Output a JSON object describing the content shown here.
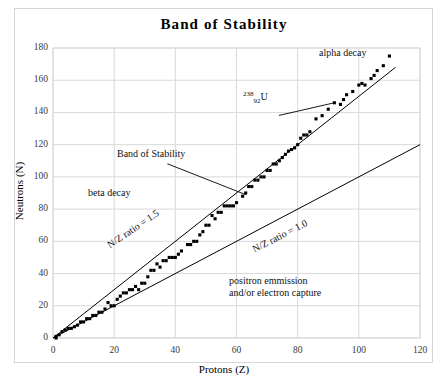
{
  "chart_data": {
    "type": "scatter",
    "title": "Band of Stability",
    "xlabel": "Protons (Z)",
    "ylabel": "Neutrons (N)",
    "xlim": [
      0,
      120
    ],
    "ylim": [
      0,
      180
    ],
    "xticks": [
      0,
      20,
      40,
      60,
      80,
      100,
      120
    ],
    "yticks": [
      0,
      20,
      40,
      60,
      80,
      100,
      120,
      140,
      160,
      180
    ],
    "grid": true,
    "legend": "none",
    "series": [
      {
        "name": "Stable nuclides (band of stability)",
        "marker": "square",
        "color": "#000000",
        "points": [
          [
            1,
            0
          ],
          [
            1,
            1
          ],
          [
            2,
            2
          ],
          [
            3,
            4
          ],
          [
            4,
            5
          ],
          [
            5,
            6
          ],
          [
            6,
            6
          ],
          [
            7,
            7
          ],
          [
            8,
            8
          ],
          [
            9,
            10
          ],
          [
            10,
            10
          ],
          [
            11,
            12
          ],
          [
            12,
            12
          ],
          [
            13,
            14
          ],
          [
            14,
            14
          ],
          [
            15,
            16
          ],
          [
            16,
            16
          ],
          [
            17,
            18
          ],
          [
            18,
            22
          ],
          [
            19,
            20
          ],
          [
            20,
            20
          ],
          [
            21,
            24
          ],
          [
            22,
            26
          ],
          [
            23,
            28
          ],
          [
            24,
            28
          ],
          [
            25,
            30
          ],
          [
            26,
            30
          ],
          [
            27,
            32
          ],
          [
            28,
            30
          ],
          [
            29,
            34
          ],
          [
            30,
            34
          ],
          [
            31,
            38
          ],
          [
            32,
            42
          ],
          [
            33,
            42
          ],
          [
            34,
            46
          ],
          [
            35,
            44
          ],
          [
            36,
            48
          ],
          [
            37,
            48
          ],
          [
            38,
            50
          ],
          [
            39,
            50
          ],
          [
            40,
            50
          ],
          [
            41,
            52
          ],
          [
            42,
            54
          ],
          [
            44,
            58
          ],
          [
            45,
            58
          ],
          [
            46,
            60
          ],
          [
            47,
            60
          ],
          [
            48,
            64
          ],
          [
            49,
            66
          ],
          [
            50,
            70
          ],
          [
            51,
            70
          ],
          [
            52,
            76
          ],
          [
            53,
            74
          ],
          [
            54,
            78
          ],
          [
            55,
            78
          ],
          [
            56,
            82
          ],
          [
            57,
            82
          ],
          [
            58,
            82
          ],
          [
            59,
            82
          ],
          [
            60,
            84
          ],
          [
            62,
            88
          ],
          [
            63,
            90
          ],
          [
            64,
            94
          ],
          [
            65,
            94
          ],
          [
            66,
            98
          ],
          [
            67,
            98
          ],
          [
            68,
            100
          ],
          [
            69,
            100
          ],
          [
            70,
            104
          ],
          [
            71,
            104
          ],
          [
            72,
            108
          ],
          [
            73,
            108
          ],
          [
            74,
            110
          ],
          [
            75,
            112
          ],
          [
            76,
            114
          ],
          [
            77,
            116
          ],
          [
            78,
            117
          ],
          [
            79,
            118
          ],
          [
            80,
            120
          ],
          [
            81,
            124
          ],
          [
            82,
            126
          ],
          [
            83,
            126
          ],
          [
            84,
            128
          ],
          [
            86,
            136
          ],
          [
            88,
            138
          ],
          [
            90,
            142
          ],
          [
            92,
            146
          ],
          [
            94,
            145
          ],
          [
            95,
            148
          ],
          [
            96,
            151
          ],
          [
            98,
            153
          ],
          [
            100,
            157
          ],
          [
            101,
            158
          ],
          [
            102,
            157
          ],
          [
            104,
            161
          ],
          [
            105,
            163
          ],
          [
            106,
            166
          ],
          [
            108,
            169
          ],
          [
            110,
            175
          ]
        ]
      }
    ],
    "reference_lines": [
      {
        "name": "N/Z ratio = 1.5",
        "label": "N/Z ratio = 1.5",
        "slope": 1.5,
        "x_from": 0,
        "x_to": 112,
        "y_from": 0,
        "y_to": 168
      },
      {
        "name": "N/Z ratio = 1.0",
        "label": "N/Z ratio = 1.0",
        "slope": 1.0,
        "x_from": 0,
        "x_to": 120,
        "y_from": 0,
        "y_to": 120
      }
    ],
    "annotations": [
      {
        "name": "alpha-decay",
        "text": "alpha decay",
        "x": 93,
        "y": 172
      },
      {
        "name": "beta-decay",
        "text": "beta decay",
        "x": 14,
        "y": 88
      },
      {
        "name": "band-of-stability",
        "text": "Band of Stability",
        "x": 23,
        "y": 110,
        "leader_to_x": 63,
        "leader_to_y": 89
      },
      {
        "name": "u238-label",
        "text": "238 92 U",
        "superscript": "238",
        "subscript": "92",
        "element": "U",
        "x": 68,
        "y": 140,
        "leader_to_x": 92,
        "leader_to_y": 146
      },
      {
        "name": "positron-emission",
        "line1": "positron emmission",
        "line2": "and/or electron capture",
        "x": 65,
        "y": 33
      }
    ]
  },
  "axes": {
    "y_tick_labels": [
      "180",
      "160",
      "140",
      "120",
      "100",
      "80",
      "60",
      "40",
      "20",
      "0"
    ],
    "x_tick_labels": [
      "0",
      "20",
      "40",
      "60",
      "80",
      "100",
      "120"
    ]
  },
  "colors": {
    "marker": "#000000",
    "line": "#000000",
    "grid": "#d9d9d9",
    "frame": "#d6d6d6",
    "text": "#111111"
  }
}
